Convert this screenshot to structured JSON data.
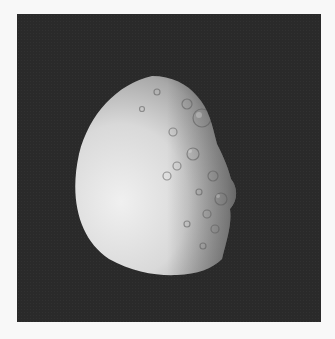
{
  "image": {
    "subject": "Crescent/gibbous icy moon with cratered surface against black space",
    "colors": {
      "page_background": "#f8f8f8",
      "space": "#2a2a2a",
      "moon_bright": "#e8e8e8",
      "moon_mid": "#b5b5b5",
      "moon_shadow": "#6a6a6a"
    }
  }
}
